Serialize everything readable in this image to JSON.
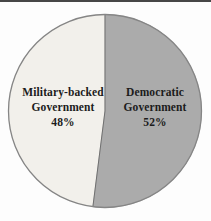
{
  "page": {
    "background": "#fdfdfd",
    "top_rule_color": "#474747"
  },
  "chart_data": {
    "type": "pie",
    "title": "",
    "direction": "counterclockwise_from_top",
    "legend_position": "inside-slices",
    "outline_color": "#858585",
    "divider_color": "#707070",
    "label_color": "#1c1c1c",
    "slices": [
      {
        "label": "Military-backed Government",
        "value": 48,
        "color": "#f2f0eb",
        "text_lines": [
          "Military-backed",
          "Government",
          "48%"
        ]
      },
      {
        "label": "Democratic Government",
        "value": 52,
        "color": "#ababab",
        "text_lines": [
          "Democratic",
          "Government",
          "52%"
        ]
      }
    ]
  }
}
